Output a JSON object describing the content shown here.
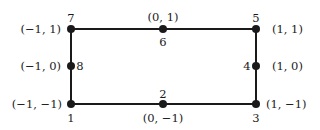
{
  "diagram": {
    "nodes": [
      {
        "id": "1",
        "coord": "(−1, −1)",
        "x": 71,
        "y": 104
      },
      {
        "id": "2",
        "coord": "(0, −1)",
        "x": 163,
        "y": 104
      },
      {
        "id": "3",
        "coord": "(1, −1)",
        "x": 256,
        "y": 104
      },
      {
        "id": "4",
        "coord": "(1, 0)",
        "x": 256,
        "y": 66
      },
      {
        "id": "5",
        "coord": "(1, 1)",
        "x": 256,
        "y": 29
      },
      {
        "id": "6",
        "coord": "(0, 1)",
        "x": 163,
        "y": 29
      },
      {
        "id": "7",
        "coord": "(−1, 1)",
        "x": 71,
        "y": 29
      },
      {
        "id": "8",
        "coord": "(−1, 0)",
        "x": 71,
        "y": 66
      }
    ],
    "edges": [
      [
        "1",
        "3"
      ],
      [
        "3",
        "5"
      ],
      [
        "5",
        "7"
      ],
      [
        "7",
        "1"
      ]
    ],
    "colors": {
      "line": "#1a1a1a",
      "background": "#ffffff"
    }
  }
}
